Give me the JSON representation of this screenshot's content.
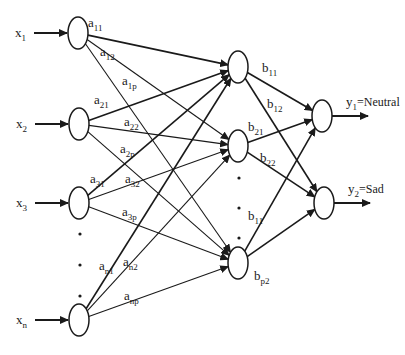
{
  "diagram": {
    "type": "feedforward-neural-network",
    "layers": {
      "input": [
        {
          "id": "x1",
          "label": "x",
          "sub": "1",
          "cx": 78,
          "cy": 33
        },
        {
          "id": "x2",
          "label": "x",
          "sub": "2",
          "cx": 79,
          "cy": 124
        },
        {
          "id": "x3",
          "label": "x",
          "sub": "3",
          "cx": 79,
          "cy": 203
        },
        {
          "id": "xn",
          "label": "x",
          "sub": "n",
          "cx": 79,
          "cy": 320
        }
      ],
      "hidden": [
        {
          "id": "h1",
          "cx": 238,
          "cy": 67
        },
        {
          "id": "h2",
          "cx": 238,
          "cy": 146
        },
        {
          "id": "hp",
          "cx": 238,
          "cy": 263
        }
      ],
      "output": [
        {
          "id": "y1",
          "label": "y",
          "sub": "1",
          "suffix": "=Neutral",
          "cx": 322,
          "cy": 116
        },
        {
          "id": "y2",
          "label": "y",
          "sub": "2",
          "suffix": "=Sad",
          "cx": 324,
          "cy": 203
        }
      ]
    },
    "weights_input_hidden": [
      {
        "from": "x1",
        "to": "h1",
        "label": "a",
        "sub": "11",
        "x": 88,
        "y": 27
      },
      {
        "from": "x1",
        "to": "h2",
        "label": "a",
        "sub": "12",
        "x": 100,
        "y": 56
      },
      {
        "from": "x1",
        "to": "hp",
        "label": "a",
        "sub": "1p",
        "x": 122,
        "y": 85
      },
      {
        "from": "x2",
        "to": "h1",
        "label": "a",
        "sub": "21",
        "x": 94,
        "y": 104
      },
      {
        "from": "x2",
        "to": "h2",
        "label": "a",
        "sub": "22",
        "x": 124,
        "y": 126
      },
      {
        "from": "x2",
        "to": "hp",
        "label": "a",
        "sub": "2p",
        "x": 120,
        "y": 153
      },
      {
        "from": "x3",
        "to": "h1",
        "label": "a",
        "sub": "31",
        "x": 90,
        "y": 183
      },
      {
        "from": "x3",
        "to": "h2",
        "label": "a",
        "sub": "32",
        "x": 125,
        "y": 183
      },
      {
        "from": "x3",
        "to": "hp",
        "label": "a",
        "sub": "3p",
        "x": 122,
        "y": 216
      },
      {
        "from": "xn",
        "to": "h1",
        "label": "a",
        "sub": "n1",
        "x": 99,
        "y": 270
      },
      {
        "from": "xn",
        "to": "h2",
        "label": "a",
        "sub": "n2",
        "x": 123,
        "y": 266
      },
      {
        "from": "xn",
        "to": "hp",
        "label": "a",
        "sub": "np",
        "x": 124,
        "y": 300
      }
    ],
    "weights_hidden_output": [
      {
        "from": "h1",
        "to": "y1",
        "label": "b",
        "sub": "11",
        "x": 262,
        "y": 72
      },
      {
        "from": "h1",
        "to": "y2",
        "label": "b",
        "sub": "12",
        "x": 267,
        "y": 108
      },
      {
        "from": "h2",
        "to": "y1",
        "label": "b",
        "sub": "21",
        "x": 248,
        "y": 131
      },
      {
        "from": "h2",
        "to": "y2",
        "label": "b",
        "sub": "22",
        "x": 260,
        "y": 162
      },
      {
        "from": "hp",
        "to": "y1",
        "label": "b",
        "sub": "11",
        "x": 248,
        "y": 220
      },
      {
        "from": "hp",
        "to": "y2",
        "label": "b",
        "sub": "p2",
        "x": 254,
        "y": 280
      }
    ],
    "ellipsis_dots": [
      {
        "x": 80,
        "y": 234
      },
      {
        "x": 80,
        "y": 265
      },
      {
        "x": 80,
        "y": 296
      },
      {
        "x": 239,
        "y": 178
      },
      {
        "x": 239,
        "y": 208
      },
      {
        "x": 239,
        "y": 238
      }
    ]
  }
}
